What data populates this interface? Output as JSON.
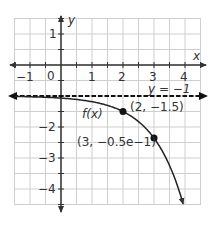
{
  "chart_data": {
    "type": "line",
    "title": "",
    "xlabel": "x",
    "ylabel": "y",
    "xlim": [
      -1.5,
      4.5
    ],
    "ylim": [
      -4.5,
      1.5
    ],
    "grid": true,
    "grid_step": 0.5,
    "x_ticks": [
      "-1",
      "0",
      "1",
      "2",
      "3",
      "4"
    ],
    "y_ticks": [
      "1",
      "-1",
      "-2",
      "-3",
      "-4"
    ],
    "series": [
      {
        "name": "f(x)",
        "equation": "f(x) = -0.5e^(x-2) - 1",
        "style": "solid",
        "x": [
          -1.5,
          -1,
          0,
          1,
          2,
          3,
          3.5,
          4,
          4.1
        ],
        "values": [
          -1.02,
          -1.02,
          -1.07,
          -1.18,
          -1.5,
          -2.36,
          -3.24,
          -4.69,
          -5.0
        ]
      },
      {
        "name": "y = -1",
        "style": "dashed",
        "x": [
          -1.5,
          4.5
        ],
        "values": [
          -1,
          -1
        ]
      }
    ],
    "points": [
      {
        "x": 2,
        "y": -1.5,
        "label": "(2, −1.5)"
      },
      {
        "x": 3,
        "y": -2.359,
        "label": "(3, −0.5e−1)"
      }
    ],
    "annotations": [
      {
        "text": "f(x)",
        "x": 0.7,
        "y": -1.8
      },
      {
        "text": "y = −1",
        "x": 3.6,
        "y": -0.7
      }
    ]
  },
  "labels": {
    "x_axis": "x",
    "y_axis": "y",
    "function": "f(x)",
    "asymptote": "y = −1",
    "point1": "(2, −1.5)",
    "point2": "(3, −0.5e−1)",
    "ticks_x": {
      "m1": "−1",
      "zero": "0",
      "p1": "1",
      "p2": "2",
      "p3": "3",
      "p4": "4"
    },
    "ticks_y": {
      "p1": "1",
      "m1": "−1",
      "m2": "−2",
      "m3": "−3",
      "m4": "−4"
    }
  },
  "colors": {
    "grid": "#cfcfcf",
    "axis": "#333333",
    "curve": "#222222",
    "asymptote": "#111111",
    "point": "#111111"
  }
}
